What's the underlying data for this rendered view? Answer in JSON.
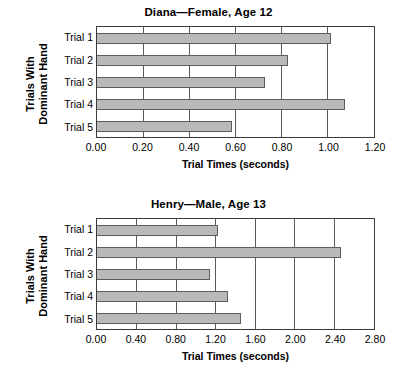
{
  "chart_data": [
    {
      "type": "bar",
      "orientation": "horizontal",
      "title": "Diana—Female, Age 12",
      "xlabel": "Trial Times (seconds)",
      "ylabel": "Trials With Dominant Hand",
      "ylabel_lines": [
        "Trials With",
        "Dominant Hand"
      ],
      "categories": [
        "Trial 1",
        "Trial 2",
        "Trial 3",
        "Trial 4",
        "Trial 5"
      ],
      "values": [
        1.02,
        0.83,
        0.73,
        1.08,
        0.59
      ],
      "xlim": [
        0.0,
        1.2
      ],
      "xticks": [
        0.0,
        0.2,
        0.4,
        0.6,
        0.8,
        1.0,
        1.2
      ],
      "xtick_labels": [
        "0.00",
        "0.20",
        "0.40",
        "0.60",
        "0.80",
        "1.00",
        "1.20"
      ],
      "grid": "vertical",
      "legend": "none",
      "bar_color": "#b9b9b9",
      "bar_edge_color": "#5d5d5d"
    },
    {
      "type": "bar",
      "orientation": "horizontal",
      "title": "Henry—Male, Age 13",
      "xlabel": "Trial Times (seconds)",
      "ylabel": "Trials With Dominant Hand",
      "ylabel_lines": [
        "Trials With",
        "Dominant Hand"
      ],
      "categories": [
        "Trial 1",
        "Trial 2",
        "Trial 3",
        "Trial 4",
        "Trial 5"
      ],
      "values": [
        1.23,
        2.48,
        1.15,
        1.33,
        1.47
      ],
      "xlim": [
        0.0,
        2.8
      ],
      "xticks": [
        0.0,
        0.4,
        0.8,
        1.2,
        1.6,
        2.0,
        2.4,
        2.8
      ],
      "xtick_labels": [
        "0.00",
        "0.40",
        "0.80",
        "1.20",
        "1.60",
        "2.00",
        "2.40",
        "2.80"
      ],
      "grid": "vertical",
      "legend": "none",
      "bar_color": "#b9b9b9",
      "bar_edge_color": "#5d5d5d"
    }
  ]
}
